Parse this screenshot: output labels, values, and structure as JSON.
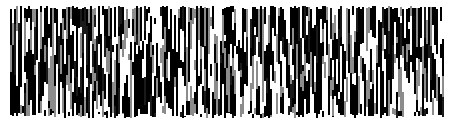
{
  "image": {
    "description": "vertical-stripe noise pattern",
    "width": 452,
    "height": 124,
    "background": "#ffffff",
    "region": {
      "x": 10,
      "y": 6,
      "width": 434,
      "height": 112
    },
    "colors": [
      "#000000",
      "#1a1a1a",
      "#8c8c8c",
      "#ffffff"
    ],
    "color_weights": [
      0.42,
      0.08,
      0.18,
      0.32
    ],
    "stripe_width": 2,
    "segment_min": 6,
    "segment_max": 40,
    "seed": 1337
  }
}
